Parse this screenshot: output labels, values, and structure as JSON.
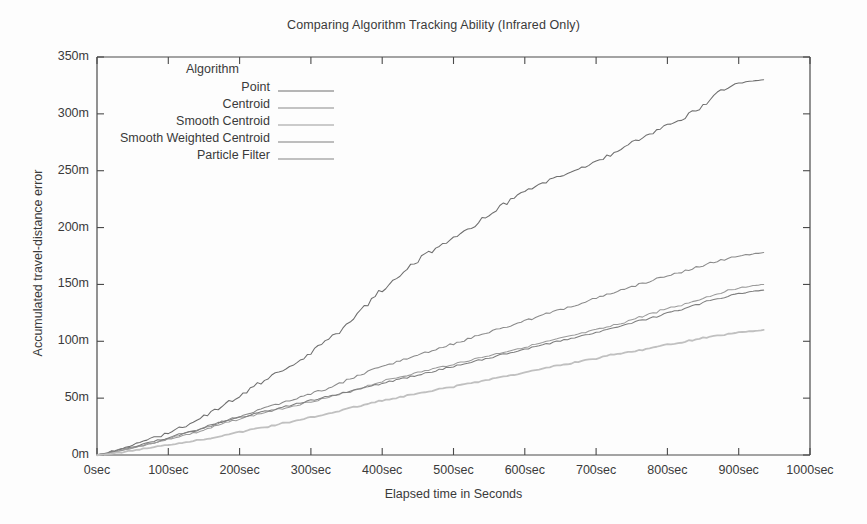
{
  "chart_data": {
    "type": "line",
    "title": "Comparing Algorithm Tracking Ability (Infrared Only)",
    "xlabel": "Elapsed time in Seconds",
    "ylabel": "Accumulated travel-distance error",
    "xlim": [
      0,
      1000
    ],
    "ylim": [
      0,
      350
    ],
    "grid": false,
    "legend_position": "upper-left-inside",
    "legend_title": "Algorithm",
    "xticks": [
      0,
      100,
      200,
      300,
      400,
      500,
      600,
      700,
      800,
      900,
      1000
    ],
    "xticklabels": [
      "0sec",
      "100sec",
      "200sec",
      "300sec",
      "400sec",
      "500sec",
      "600sec",
      "700sec",
      "800sec",
      "900sec",
      "1000sec"
    ],
    "yticks": [
      0,
      50,
      100,
      150,
      200,
      250,
      300,
      350
    ],
    "yticklabels": [
      "0m",
      "50m",
      "100m",
      "150m",
      "200m",
      "250m",
      "300m",
      "350m"
    ],
    "note": "All series accumulate monotonically from the origin and terminate near 935 sec.",
    "series": [
      {
        "name": "Point",
        "color": "#6e6e6e",
        "final_value": 330,
        "x": [
          0,
          20,
          40,
          60,
          80,
          100,
          120,
          140,
          160,
          180,
          200,
          220,
          240,
          260,
          280,
          300,
          320,
          340,
          360,
          380,
          400,
          420,
          440,
          460,
          480,
          500,
          520,
          540,
          560,
          580,
          600,
          620,
          640,
          660,
          680,
          700,
          720,
          740,
          760,
          780,
          800,
          820,
          840,
          860,
          880,
          900,
          920,
          935
        ],
        "values": [
          0,
          3,
          7,
          11,
          15,
          20,
          25,
          30,
          38,
          45,
          52,
          60,
          68,
          75,
          82,
          90,
          100,
          110,
          122,
          134,
          146,
          157,
          167,
          176,
          183,
          190,
          198,
          207,
          216,
          224,
          232,
          238,
          243,
          248,
          253,
          258,
          264,
          271,
          278,
          284,
          290,
          296,
          303,
          312,
          322,
          327,
          329,
          330
        ]
      },
      {
        "name": "Centroid",
        "color": "#8a8a8a",
        "final_value": 178,
        "x": [
          0,
          20,
          40,
          60,
          80,
          100,
          120,
          140,
          160,
          180,
          200,
          220,
          240,
          260,
          280,
          300,
          320,
          340,
          360,
          380,
          400,
          420,
          440,
          460,
          480,
          500,
          520,
          540,
          560,
          580,
          600,
          620,
          640,
          660,
          680,
          700,
          720,
          740,
          760,
          780,
          800,
          820,
          840,
          860,
          880,
          900,
          920,
          935
        ],
        "values": [
          0,
          2,
          5,
          8,
          11,
          14,
          18,
          22,
          26,
          30,
          34,
          38,
          42,
          46,
          50,
          54,
          58,
          63,
          68,
          73,
          78,
          82,
          86,
          90,
          94,
          98,
          102,
          106,
          110,
          114,
          118,
          122,
          126,
          130,
          134,
          138,
          142,
          146,
          150,
          154,
          158,
          161,
          165,
          169,
          172,
          175,
          177,
          178
        ]
      },
      {
        "name": "Smooth Centroid",
        "color": "#9a9a9a",
        "final_value": 150,
        "x": [
          0,
          20,
          40,
          60,
          80,
          100,
          120,
          140,
          160,
          180,
          200,
          220,
          240,
          260,
          280,
          300,
          320,
          340,
          360,
          380,
          400,
          420,
          440,
          460,
          480,
          500,
          520,
          540,
          560,
          580,
          600,
          620,
          640,
          660,
          680,
          700,
          720,
          740,
          760,
          780,
          800,
          820,
          840,
          860,
          880,
          900,
          920,
          935
        ],
        "values": [
          0,
          2,
          5,
          8,
          11,
          14,
          17,
          20,
          24,
          28,
          32,
          35,
          38,
          41,
          44,
          47,
          50,
          53,
          57,
          61,
          65,
          68,
          71,
          74,
          77,
          80,
          83,
          86,
          89,
          92,
          95,
          98,
          101,
          104,
          107,
          110,
          113,
          117,
          121,
          125,
          129,
          132,
          136,
          140,
          144,
          147,
          149,
          150
        ]
      },
      {
        "name": "Smooth Weighted Centroid",
        "color": "#7e7e7e",
        "final_value": 145,
        "x": [
          0,
          20,
          40,
          60,
          80,
          100,
          120,
          140,
          160,
          180,
          200,
          220,
          240,
          260,
          280,
          300,
          320,
          340,
          360,
          380,
          400,
          420,
          440,
          460,
          480,
          500,
          520,
          540,
          560,
          580,
          600,
          620,
          640,
          660,
          680,
          700,
          720,
          740,
          760,
          780,
          800,
          820,
          840,
          860,
          880,
          900,
          920,
          935
        ],
        "values": [
          0,
          3,
          6,
          9,
          12,
          15,
          19,
          22,
          26,
          30,
          33,
          36,
          39,
          42,
          45,
          48,
          51,
          54,
          57,
          60,
          63,
          66,
          69,
          72,
          75,
          78,
          81,
          84,
          87,
          90,
          93,
          96,
          99,
          102,
          105,
          108,
          111,
          114,
          118,
          121,
          125,
          128,
          132,
          136,
          139,
          142,
          144,
          145
        ]
      },
      {
        "name": "Particle Filter",
        "color": "#c0c0c0",
        "final_value": 110,
        "x": [
          0,
          20,
          40,
          60,
          80,
          100,
          120,
          140,
          160,
          180,
          200,
          220,
          240,
          260,
          280,
          300,
          320,
          340,
          360,
          380,
          400,
          420,
          440,
          460,
          480,
          500,
          520,
          540,
          560,
          580,
          600,
          620,
          640,
          660,
          680,
          700,
          720,
          740,
          760,
          780,
          800,
          820,
          840,
          860,
          880,
          900,
          920,
          935
        ],
        "values": [
          0,
          1,
          3,
          5,
          7,
          9,
          11,
          13,
          15,
          18,
          20,
          23,
          25,
          28,
          30,
          33,
          36,
          39,
          42,
          45,
          48,
          50,
          53,
          55,
          58,
          60,
          63,
          65,
          68,
          70,
          73,
          75,
          78,
          80,
          83,
          85,
          88,
          90,
          92,
          95,
          97,
          99,
          102,
          104,
          106,
          108,
          109,
          110
        ]
      }
    ]
  },
  "axis": {
    "frame_color": "#4a4a4a"
  }
}
